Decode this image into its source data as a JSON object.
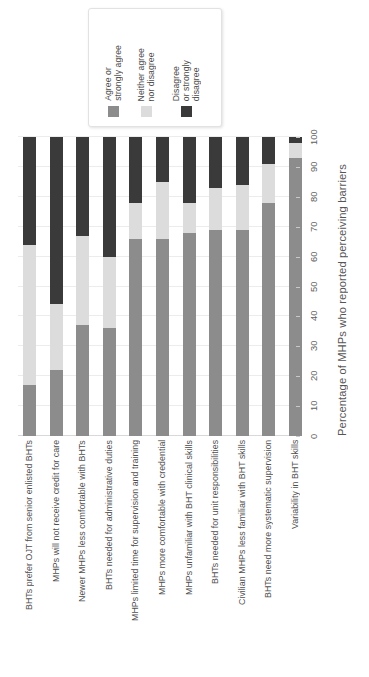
{
  "chart_data": {
    "type": "bar",
    "subtype": "stacked-bar-horizontal-rotated",
    "title": "",
    "xlabel": "",
    "ylabel": "Percentage of MHPs who reported perceiving barriers",
    "ylim": [
      0,
      100
    ],
    "yticks": [
      0,
      10,
      20,
      30,
      40,
      50,
      60,
      70,
      80,
      90,
      100
    ],
    "grid": true,
    "legend_position": "top",
    "orientation": "rotated-90",
    "categories": [
      "BHTs prefer OJT from senior enlisted BHTs",
      "MHPs will not receive credit for care",
      "Newer MHPs less comfortable with BHTs",
      "BHTs needed for administrative duties",
      "MHPs limited time for supervision and training",
      "MHPs more comfortable with credential",
      "MHPs unfamiliar with BHT clinical skills",
      "BHTs needed for unit responsibilities",
      "Civilian MHPs less familiar with BHT skills",
      "BHTs need more systematic supervision",
      "Variability in BHT skills"
    ],
    "series": [
      {
        "name": "Agree or strongly agree",
        "color": "#8c8c8c",
        "values": [
          17,
          22,
          37,
          36,
          66,
          66,
          68,
          69,
          69,
          78,
          93
        ]
      },
      {
        "name": "Neither agree nor disagree",
        "color": "#dcdcdc",
        "values": [
          47,
          22,
          30,
          24,
          12,
          19,
          10,
          14,
          15,
          13,
          5
        ]
      },
      {
        "name": "Disagree or strongly disagree",
        "color": "#3a3a3a",
        "values": [
          36,
          56,
          33,
          40,
          22,
          15,
          22,
          17,
          16,
          9,
          2
        ]
      }
    ]
  },
  "legend": {
    "items": [
      {
        "label": "Agree or\nstrongly agree",
        "color": "#8c8c8c"
      },
      {
        "label": "Neither agree\nnor disagree",
        "color": "#dcdcdc"
      },
      {
        "label": "Disagree\nor strongly\ndisagree",
        "color": "#3a3a3a"
      }
    ]
  },
  "axis": {
    "title": "Percentage of MHPs who reported perceiving barriers",
    "ticks": [
      "0",
      "10",
      "20",
      "30",
      "40",
      "50",
      "60",
      "70",
      "80",
      "90",
      "100"
    ]
  }
}
